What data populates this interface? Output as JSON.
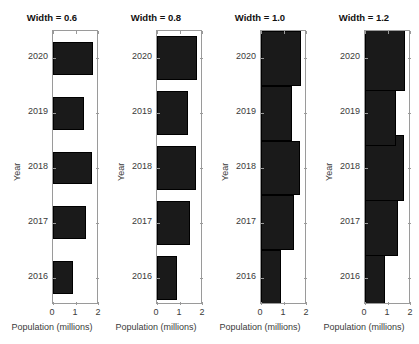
{
  "figure": {
    "background": "#ffffff",
    "bar_color": "#1a1a1a",
    "axis_color": "#9a9a9a",
    "text_color": "#3a3a3a"
  },
  "chart_data": [
    {
      "type": "bar",
      "orientation": "horizontal",
      "title": "Width = 0.6",
      "bar_width": 0.6,
      "xlabel": "Population (millions)",
      "ylabel": "Year",
      "categories": [
        "2016",
        "2017",
        "2018",
        "2019",
        "2020"
      ],
      "values": [
        0.87,
        1.43,
        1.68,
        1.33,
        1.75
      ],
      "xlim": [
        0,
        2
      ],
      "xticks": [
        "0",
        "1",
        "2"
      ],
      "xtick_values": [
        0,
        1,
        2
      ],
      "ylim": [
        2015.5,
        2020.5
      ],
      "yticks": [
        "2016",
        "2017",
        "2018",
        "2019",
        "2020"
      ],
      "grid": false,
      "legend": "none"
    },
    {
      "type": "bar",
      "orientation": "horizontal",
      "title": "Width = 0.8",
      "bar_width": 0.8,
      "xlabel": "Population (millions)",
      "ylabel": "Year",
      "categories": [
        "2016",
        "2017",
        "2018",
        "2019",
        "2020"
      ],
      "values": [
        0.87,
        1.43,
        1.68,
        1.33,
        1.75
      ],
      "xlim": [
        0,
        2
      ],
      "xticks": [
        "0",
        "1",
        "2"
      ],
      "xtick_values": [
        0,
        1,
        2
      ],
      "ylim": [
        2015.5,
        2020.5
      ],
      "yticks": [
        "2016",
        "2017",
        "2018",
        "2019",
        "2020"
      ],
      "grid": false,
      "legend": "none"
    },
    {
      "type": "bar",
      "orientation": "horizontal",
      "title": "Width = 1.0",
      "bar_width": 1.0,
      "xlabel": "Population (millions)",
      "ylabel": "Year",
      "categories": [
        "2016",
        "2017",
        "2018",
        "2019",
        "2020"
      ],
      "values": [
        0.87,
        1.43,
        1.68,
        1.33,
        1.75
      ],
      "xlim": [
        0,
        2
      ],
      "xticks": [
        "0",
        "1",
        "2"
      ],
      "xtick_values": [
        0,
        1,
        2
      ],
      "ylim": [
        2015.5,
        2020.5
      ],
      "yticks": [
        "2016",
        "2017",
        "2018",
        "2019",
        "2020"
      ],
      "grid": false,
      "legend": "none"
    },
    {
      "type": "bar",
      "orientation": "horizontal",
      "title": "Width = 1.2",
      "bar_width": 1.2,
      "xlabel": "Population (millions)",
      "ylabel": "Year",
      "categories": [
        "2016",
        "2017",
        "2018",
        "2019",
        "2020"
      ],
      "values": [
        0.87,
        1.43,
        1.68,
        1.33,
        1.75
      ],
      "xlim": [
        0,
        2
      ],
      "xticks": [
        "0",
        "1",
        "2"
      ],
      "xtick_values": [
        0,
        1,
        2
      ],
      "ylim": [
        2015.5,
        2020.5
      ],
      "yticks": [
        "2016",
        "2017",
        "2018",
        "2019",
        "2020"
      ],
      "grid": false,
      "legend": "none"
    }
  ]
}
